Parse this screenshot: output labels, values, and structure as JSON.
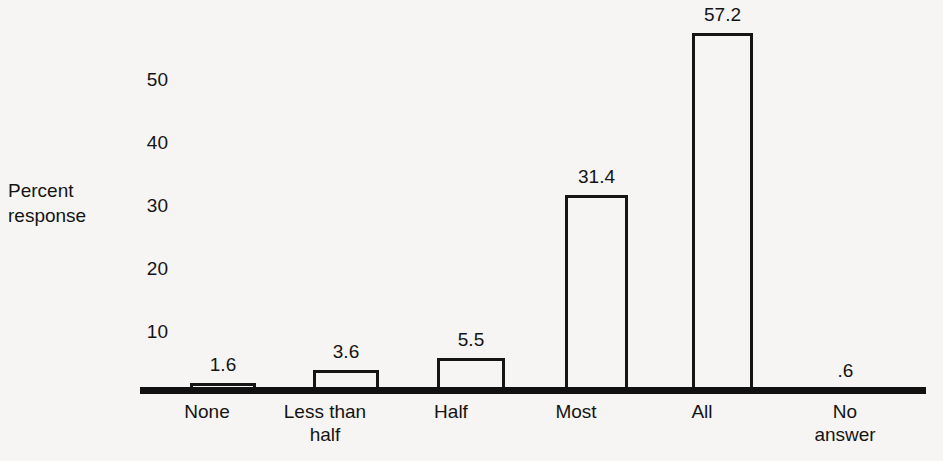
{
  "chart_data": {
    "type": "bar",
    "title": "",
    "subtitle": "",
    "xlabel": "",
    "ylabel": "Percent response",
    "ylabel_lines": [
      "Percent",
      "response"
    ],
    "categories": [
      "None",
      "Less than half",
      "Half",
      "Most",
      "All",
      "No answer"
    ],
    "category_label_lines": [
      [
        "None"
      ],
      [
        "Less than",
        "half"
      ],
      [
        "Half"
      ],
      [
        "Most"
      ],
      [
        "All"
      ],
      [
        "No",
        "answer"
      ]
    ],
    "values": [
      1.6,
      3.6,
      5.5,
      31.4,
      57.2,
      0.6
    ],
    "value_labels": [
      "1.6",
      "3.6",
      "5.5",
      "31.4",
      "57.2",
      ".6"
    ],
    "ylim": [
      0,
      60
    ],
    "yticks": [
      10,
      20,
      30,
      40,
      50
    ],
    "ytick_labels": [
      "10",
      "20",
      "30",
      "40",
      "50"
    ],
    "grid": false,
    "legend": null,
    "legend_position": "none",
    "bar_fill_color": "#f6f5f3",
    "bar_edge_color": "#151515",
    "axis_color": "#111111",
    "background_color": "#f6f5f3",
    "text_color": "#141414"
  }
}
